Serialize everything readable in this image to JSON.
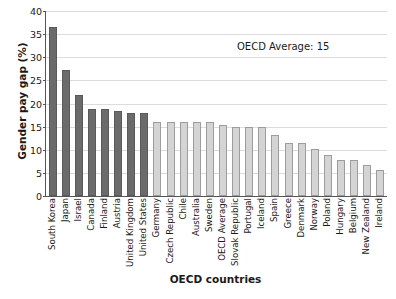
{
  "chart_data": {
    "type": "bar",
    "title": "",
    "xlabel": "OECD countries",
    "ylabel": "Gender pay gap (%)",
    "ylim": [
      0,
      40
    ],
    "yticks": [
      0,
      5,
      10,
      15,
      20,
      25,
      30,
      35,
      40
    ],
    "grid": true,
    "legend": "none",
    "annotations": [
      "OECD Average: 15"
    ],
    "categories": [
      "South Korea",
      "Japan",
      "Israel",
      "Canada",
      "Finland",
      "Austria",
      "United Kingdom",
      "United States",
      "Germany",
      "Czech Republic",
      "Chile",
      "Australia",
      "Sweden",
      "OECD Average",
      "Slovak Republic",
      "Portugal",
      "Iceland",
      "Spain",
      "Greece",
      "Denmark",
      "Norway",
      "Poland",
      "Hungary",
      "Belgium",
      "New Zealand",
      "Ireland"
    ],
    "values": [
      36.6,
      27.2,
      21.8,
      18.9,
      18.9,
      18.4,
      17.9,
      17.9,
      16.0,
      16.0,
      16.0,
      16.0,
      16.0,
      15.4,
      15.0,
      15.0,
      14.9,
      13.3,
      11.5,
      11.4,
      10.2,
      8.8,
      7.7,
      7.7,
      6.8,
      5.6
    ],
    "bar_styles": [
      "dark",
      "dark",
      "dark",
      "dark",
      "dark",
      "dark",
      "dark",
      "dark",
      "light",
      "light",
      "light",
      "light",
      "light",
      "light",
      "light",
      "light",
      "light",
      "light",
      "light",
      "light",
      "light",
      "light",
      "light",
      "light",
      "light",
      "light"
    ],
    "colors": {
      "dark_bar": "#6b6b6b",
      "dark_bar_border": "#5a5a5a",
      "light_bar": "#d4d4d4",
      "light_bar_border": "#9d9d9d",
      "gridline": "#dcdcdc",
      "axis": "#555555",
      "text": "#1a1a1a",
      "background": "#ffffff"
    }
  }
}
